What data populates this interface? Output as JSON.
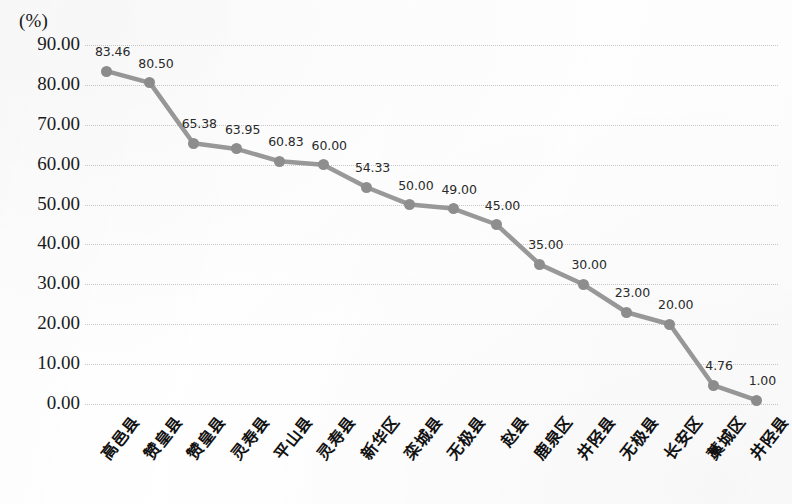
{
  "axis": {
    "unit_label": "(%)",
    "y_ticks": [
      "90.00",
      "80.00",
      "70.00",
      "60.00",
      "50.00",
      "40.00",
      "30.00",
      "20.00",
      "10.00",
      "0.00"
    ]
  },
  "chart_data": {
    "type": "line",
    "title": "",
    "xlabel": "",
    "ylabel": "(%)",
    "ylim": [
      0,
      90
    ],
    "ytick_step": 10,
    "grid": true,
    "legend": "none",
    "marker_color": "#8f8f8f",
    "line_color": "#9a9a9a",
    "categories": [
      "高邑县",
      "赞皇县",
      "赞皇县",
      "灵寿县",
      "平山县",
      "灵寿县",
      "新华区",
      "栾城县",
      "无极县",
      "赵县",
      "鹿泉区",
      "井陉县",
      "无极县",
      "长安区",
      "藁城区",
      "井陉县"
    ],
    "values": [
      83.46,
      80.5,
      65.38,
      63.95,
      60.83,
      60.0,
      54.33,
      50.0,
      49.0,
      45.0,
      35.0,
      30.0,
      23.0,
      20.0,
      4.76,
      1.0
    ],
    "value_labels": [
      "83.46",
      "80.50",
      "65.38",
      "63.95",
      "60.83",
      "60.00",
      "54.33",
      "50.00",
      "49.00",
      "45.00",
      "35.00",
      "30.00",
      "23.00",
      "20.00",
      "4.76",
      "1.00"
    ]
  }
}
